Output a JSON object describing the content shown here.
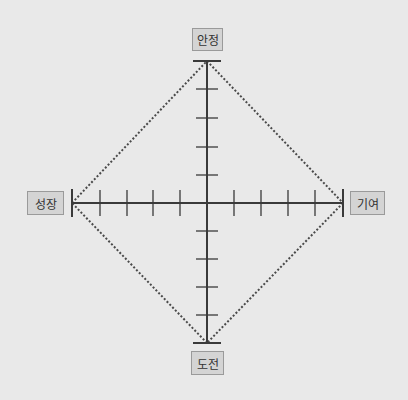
{
  "diagram": {
    "type": "quadrant-axis",
    "labels": {
      "top": "안정",
      "bottom": "도전",
      "left": "성장",
      "right": "기여"
    },
    "ticks_per_half_axis": 4,
    "colors": {
      "background": "#e9e9e9",
      "axis": "#3a3a3a",
      "dotted_diamond": "#4a4a4a",
      "label_fill": "#d4d4d4",
      "label_border": "#9a9a9a"
    }
  }
}
